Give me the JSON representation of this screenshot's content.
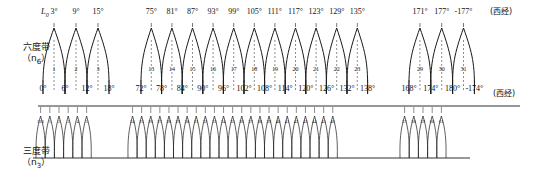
{
  "figure": {
    "type": "zone-diagram",
    "origin_label": "L",
    "origin_sub": "0",
    "west_note": "(西经)",
    "rows": [
      {
        "id": "six-degree",
        "label_main": "六度带",
        "label_sub_open": "（n",
        "label_sub_index": "6",
        "label_sub_close": "）",
        "central_meridians": [
          "3°",
          "9°",
          "15°",
          "75°",
          "81°",
          "87°",
          "93°",
          "99°",
          "105°",
          "111°",
          "117°",
          "123°",
          "129°",
          "135°",
          "171°",
          "177°",
          "-177°"
        ],
        "boundaries": [
          "0°",
          "6°",
          "12°",
          "18°",
          "72°",
          "78°",
          "84°",
          "90°",
          "96°",
          "102°",
          "108°",
          "114°",
          "120°",
          "126°",
          "132°",
          "138°",
          "168°",
          "174°",
          "180°",
          "-174°"
        ],
        "zone_numbers": [
          "1",
          "2",
          "3",
          "13",
          "14",
          "15",
          "16",
          "17",
          "18",
          "19",
          "20",
          "21",
          "22",
          "23",
          "29",
          "30",
          "31"
        ]
      },
      {
        "id": "three-degree",
        "label_main": "三度带",
        "label_sub_open": "（n",
        "label_sub_index": "3",
        "label_sub_close": "）",
        "zone_numbers": [
          "120",
          "1",
          "2",
          "3",
          "4",
          "5",
          "24",
          "25",
          "26",
          "27",
          "28",
          "29",
          "30",
          "31",
          "32",
          "33",
          "34",
          "35",
          "36",
          "37",
          "38",
          "39",
          "40",
          "41",
          "42",
          "43",
          "44",
          "45",
          "46",
          "57",
          "58",
          "59",
          "60",
          "61"
        ]
      }
    ],
    "colors": {
      "line": "#1a1a1a",
      "axis": "#1a1a1a",
      "background": "#ffffff"
    }
  },
  "chart_data": {
    "type": "line",
    "title": "",
    "xlabel": "",
    "ylabel": "",
    "series": [
      {
        "name": "six-degree zones",
        "central_meridians": [
          3,
          9,
          15,
          75,
          81,
          87,
          93,
          99,
          105,
          111,
          117,
          123,
          129,
          135,
          171,
          177,
          -177
        ],
        "zone_numbers": [
          1,
          2,
          3,
          13,
          14,
          15,
          16,
          17,
          18,
          19,
          20,
          21,
          22,
          23,
          29,
          30,
          31
        ],
        "zone_width_deg": 6,
        "boundaries": [
          0,
          6,
          12,
          18,
          72,
          78,
          84,
          90,
          96,
          102,
          108,
          114,
          120,
          126,
          132,
          138,
          168,
          174,
          180,
          -174
        ]
      },
      {
        "name": "three-degree zones",
        "zone_numbers": [
          120,
          1,
          2,
          3,
          4,
          5,
          24,
          25,
          26,
          27,
          28,
          29,
          30,
          31,
          32,
          33,
          34,
          35,
          36,
          37,
          38,
          39,
          40,
          41,
          42,
          43,
          44,
          45,
          46,
          57,
          58,
          59,
          60,
          61
        ],
        "zone_width_deg": 3
      }
    ],
    "grid": false,
    "legend": "none"
  }
}
